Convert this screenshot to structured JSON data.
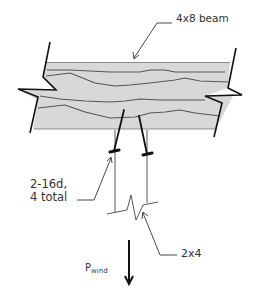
{
  "diagram": {
    "type": "structural-connection-detail",
    "labels": {
      "beam": "4x8 beam",
      "nails_line1": "2-16d,",
      "nails_line2": "4 total",
      "stud": "2x4",
      "load_main": "P",
      "load_sub": "wind"
    },
    "colors": {
      "beam_fill": "#d8d8d8",
      "grain": "#555555",
      "line": "#111111",
      "leader": "#333333",
      "text": "#333333"
    },
    "elements": [
      "4x8 wood beam with grain lines and break symbols at both ends",
      "two toe-nails (2-16d, 4 total) driven from beam into stud",
      "2x4 stud hanging below beam with break symbol",
      "downward wind load arrow P_wind"
    ]
  }
}
